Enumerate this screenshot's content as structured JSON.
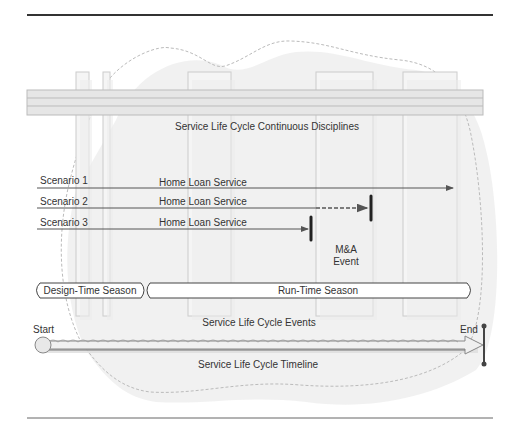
{
  "diagram": {
    "disciplines_label": "Service Life Cycle Continuous Disciplines",
    "scenarios": [
      {
        "label": "Scenario 1",
        "service": "Home Loan Service",
        "end": "arrow"
      },
      {
        "label": "Scenario 2",
        "service": "Home Loan Service",
        "end": "dashed-bar"
      },
      {
        "label": "Scenario 3",
        "service": "Home Loan Service",
        "end": "bar"
      }
    ],
    "event_label_line1": "M&A",
    "event_label_line2": "Event",
    "seasons": {
      "design_time": "Design-Time Season",
      "run_time": "Run-Time Season"
    },
    "events_label": "Service Life Cycle Events",
    "timeline": {
      "start": "Start",
      "end": "End",
      "label": "Service Life Cycle Timeline"
    },
    "colors": {
      "line": "#555555",
      "band": "#e6e6e6",
      "column": "#f2f2f2",
      "dashed_outline": "#bbbbbb"
    }
  }
}
